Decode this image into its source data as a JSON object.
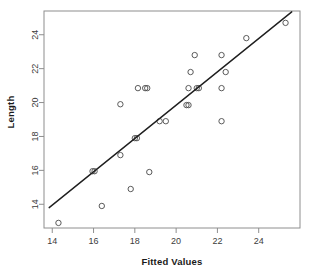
{
  "chart_data": {
    "type": "scatter",
    "title": "",
    "xlabel": "Fitted Values",
    "ylabel": "Length",
    "xlim": [
      13.6,
      26.0
    ],
    "ylim": [
      12.6,
      25.4
    ],
    "xticks": [
      14,
      16,
      18,
      20,
      22,
      24
    ],
    "yticks": [
      14,
      16,
      18,
      20,
      22,
      24
    ],
    "grid": false,
    "legend": null,
    "frame": true,
    "points": [
      {
        "x": 14.3,
        "y": 12.9
      },
      {
        "x": 16.4,
        "y": 13.9
      },
      {
        "x": 17.8,
        "y": 14.9
      },
      {
        "x": 18.7,
        "y": 15.9
      },
      {
        "x": 15.95,
        "y": 15.95
      },
      {
        "x": 16.05,
        "y": 15.95
      },
      {
        "x": 17.3,
        "y": 16.9
      },
      {
        "x": 18.0,
        "y": 17.9
      },
      {
        "x": 18.1,
        "y": 17.9
      },
      {
        "x": 19.2,
        "y": 18.9
      },
      {
        "x": 19.5,
        "y": 18.9
      },
      {
        "x": 22.2,
        "y": 18.9
      },
      {
        "x": 17.3,
        "y": 19.9
      },
      {
        "x": 20.5,
        "y": 19.85
      },
      {
        "x": 20.6,
        "y": 19.85
      },
      {
        "x": 18.15,
        "y": 20.85
      },
      {
        "x": 18.5,
        "y": 20.85
      },
      {
        "x": 18.6,
        "y": 20.85
      },
      {
        "x": 20.6,
        "y": 20.85
      },
      {
        "x": 21.0,
        "y": 20.85
      },
      {
        "x": 21.1,
        "y": 20.85
      },
      {
        "x": 22.2,
        "y": 20.85
      },
      {
        "x": 20.7,
        "y": 21.8
      },
      {
        "x": 22.4,
        "y": 21.8
      },
      {
        "x": 20.9,
        "y": 22.8
      },
      {
        "x": 22.2,
        "y": 22.8
      },
      {
        "x": 23.4,
        "y": 23.8
      },
      {
        "x": 25.3,
        "y": 24.7
      }
    ],
    "fit_line": {
      "x1": 13.85,
      "y1": 13.8,
      "x2": 25.6,
      "y2": 25.35
    }
  }
}
